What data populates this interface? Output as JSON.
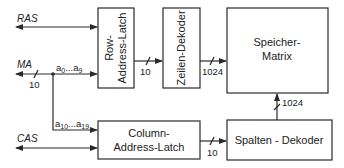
{
  "signals": {
    "ras": "RAS",
    "ma": "MA",
    "cas": "CAS"
  },
  "bus_labels": {
    "ma_width": "10",
    "row_out": "10",
    "zeilen_out": "1024",
    "col_out": "10",
    "spalten_out": "1024",
    "row_addr_base": "a",
    "row_addr_from": "0",
    "row_addr_to": "9",
    "col_addr_base": "a",
    "col_addr_from": "10",
    "col_addr_to": "19",
    "ellipsis": "..."
  },
  "blocks": {
    "row_latch": [
      "Row-",
      "Address-Latch"
    ],
    "zeilen_dekoder": "Zeilen-Dekoder",
    "speicher_matrix": [
      "Speicher-",
      "Matrix"
    ],
    "column_latch": [
      "Column-",
      "Address-Latch"
    ],
    "spalten_dekoder": "Spalten - Dekoder"
  }
}
